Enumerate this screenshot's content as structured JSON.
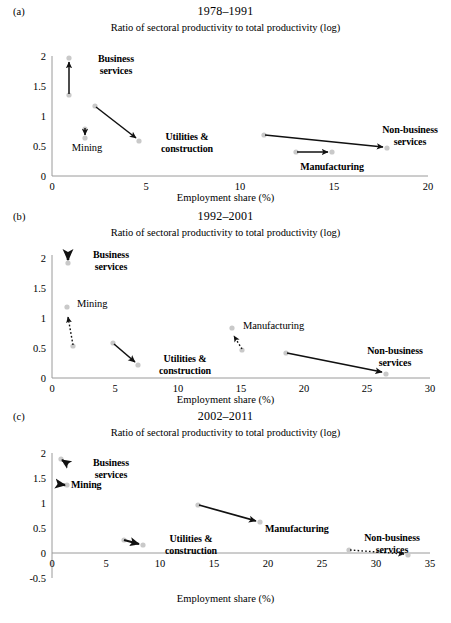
{
  "figure": {
    "axis_label_x": "Employment share (%)",
    "axis_label_y": "Ratio of sectoral productivity to total productivity (log)"
  },
  "panels": [
    {
      "tag": "(a)",
      "title": "1978–1991",
      "axis_label_x": "Employment share (%)",
      "axis_label_y": "Ratio of sectoral productivity to total productivity (log)",
      "xticks": [
        "0",
        "5",
        "10",
        "15",
        "20"
      ],
      "yticks": [
        "0",
        "0.5",
        "1",
        "1.5",
        "2"
      ],
      "labels": {
        "business": "Business\nservices",
        "mining": "Mining",
        "utilities": "Utilities &\nconstruction",
        "manufacturing": "Manufacturing",
        "nonbusiness": "Non-business\nservices"
      }
    },
    {
      "tag": "(b)",
      "title": "1992–2001",
      "axis_label_x": "Employment share (%)",
      "axis_label_y": "Ratio of sectoral productivity to total productivity (log)",
      "xticks": [
        "0",
        "5",
        "10",
        "15",
        "20",
        "25",
        "30"
      ],
      "yticks": [
        "0",
        "0.5",
        "1",
        "1.5",
        "2"
      ],
      "labels": {
        "business": "Business\nservices",
        "mining": "Mining",
        "utilities": "Utilities &\nconstruction",
        "manufacturing": "Manufacturing",
        "nonbusiness": "Non-business\nservices"
      }
    },
    {
      "tag": "(c)",
      "title": "2002–2011",
      "axis_label_x": "Employment share (%)",
      "axis_label_y": "Ratio of sectoral productivity to total productivity (log)",
      "xticks": [
        "0",
        "5",
        "10",
        "15",
        "20",
        "25",
        "30",
        "35"
      ],
      "yticks": [
        "-0.5",
        "0",
        "0.5",
        "1",
        "1.5",
        "2"
      ],
      "labels": {
        "business": "Business\nservices",
        "mining": "Mining",
        "utilities": "Utilities &\nconstruction",
        "manufacturing": "Manufacturing",
        "nonbusiness": "Non-business\nservices"
      }
    }
  ],
  "chart_data": [
    {
      "type": "scatter",
      "panel": "(a)",
      "title": "1978–1991",
      "xlabel": "Employment share (%)",
      "ylabel": "Ratio of sectoral productivity to total productivity (log)",
      "xlim": [
        0,
        20
      ],
      "ylim": [
        0,
        2.1
      ],
      "xticks": [
        0,
        5,
        10,
        15,
        20
      ],
      "yticks": [
        0,
        0.5,
        1,
        1.5,
        2
      ],
      "grid": false,
      "legend": "none",
      "note": "Each sector is drawn as an arrow from its start-of-period point to its end-of-period point; solid arrows indicate a productivity gain, dotted arrows a productivity loss.",
      "series": [
        {
          "name": "Business services",
          "start": [
            0.9,
            1.35
          ],
          "end": [
            0.9,
            1.97
          ],
          "style": "solid"
        },
        {
          "name": "Mining",
          "start": [
            1.75,
            0.78
          ],
          "end": [
            1.75,
            0.64
          ],
          "style": "solid"
        },
        {
          "name": "Utilities & construction",
          "start": [
            2.3,
            1.17
          ],
          "end": [
            4.6,
            0.58
          ],
          "style": "solid"
        },
        {
          "name": "Manufacturing",
          "start": [
            13.0,
            0.4
          ],
          "end": [
            14.9,
            0.4
          ],
          "style": "solid"
        },
        {
          "name": "Non-business services",
          "start": [
            11.3,
            0.68
          ],
          "end": [
            17.8,
            0.47
          ],
          "style": "solid"
        }
      ]
    },
    {
      "type": "scatter",
      "panel": "(b)",
      "title": "1992–2001",
      "xlabel": "Employment share (%)",
      "ylabel": "Ratio of sectoral productivity to total productivity (log)",
      "xlim": [
        0,
        30
      ],
      "ylim": [
        0,
        2.15
      ],
      "xticks": [
        0,
        5,
        10,
        15,
        20,
        25,
        30
      ],
      "yticks": [
        0,
        0.5,
        1,
        1.5,
        2
      ],
      "grid": false,
      "legend": "none",
      "note": "Each sector is drawn as an arrow from its start-of-period point to its end-of-period point; solid arrows indicate a productivity gain, dotted arrows a productivity loss.",
      "series": [
        {
          "name": "Business services",
          "start": [
            1.25,
            1.92
          ],
          "end": [
            1.25,
            2.06
          ],
          "style": "solid"
        },
        {
          "name": "Mining",
          "start": [
            1.7,
            0.54
          ],
          "end": [
            1.2,
            1.18
          ],
          "style": "dotted"
        },
        {
          "name": "Utilities & construction",
          "start": [
            4.8,
            0.58
          ],
          "end": [
            6.8,
            0.22
          ],
          "style": "solid"
        },
        {
          "name": "Manufacturing",
          "start": [
            15.1,
            0.47
          ],
          "end": [
            14.3,
            0.84
          ],
          "style": "dotted"
        },
        {
          "name": "Non-business services",
          "start": [
            18.6,
            0.42
          ],
          "end": [
            26.5,
            0.08
          ],
          "style": "solid"
        }
      ]
    },
    {
      "type": "scatter",
      "panel": "(c)",
      "title": "2002–2011",
      "xlabel": "Employment share (%)",
      "ylabel": "Ratio of sectoral productivity to total productivity (log)",
      "xlim": [
        0,
        35
      ],
      "ylim": [
        -0.5,
        2.1
      ],
      "xticks": [
        0,
        5,
        10,
        15,
        20,
        25,
        30,
        35
      ],
      "yticks": [
        -0.5,
        0,
        0.5,
        1,
        1.5,
        2
      ],
      "grid": false,
      "legend": "none",
      "note": "Each sector is drawn as an arrow from its start-of-period point to its end-of-period point; solid arrows indicate a productivity gain, dotted arrows a productivity loss.",
      "series": [
        {
          "name": "Business services",
          "start": [
            1.3,
            1.8
          ],
          "end": [
            0.8,
            1.88
          ],
          "style": "solid"
        },
        {
          "name": "Mining",
          "start": [
            0.7,
            1.38
          ],
          "end": [
            1.4,
            1.36
          ],
          "style": "solid"
        },
        {
          "name": "Utilities & construction",
          "start": [
            6.7,
            0.26
          ],
          "end": [
            8.4,
            0.17
          ],
          "style": "solid"
        },
        {
          "name": "Manufacturing",
          "start": [
            13.5,
            0.96
          ],
          "end": [
            19.3,
            0.63
          ],
          "style": "solid"
        },
        {
          "name": "Non-business services",
          "start": [
            27.5,
            0.07
          ],
          "end": [
            32.9,
            -0.02
          ],
          "style": "dotted"
        }
      ]
    }
  ]
}
